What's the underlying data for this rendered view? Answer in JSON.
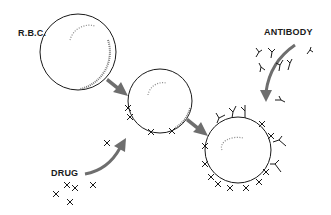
{
  "labels": {
    "rbc": "R.B.C.",
    "antibody": "ANTIBODY",
    "drug": "DRUG"
  },
  "colors": {
    "arrow": "#6e6e6e",
    "outline": "#1a1a1a",
    "background": "#ffffff"
  },
  "stages": [
    {
      "name": "red blood cell",
      "attached": "none"
    },
    {
      "name": "drug-coated red blood cell",
      "attached": "drug"
    },
    {
      "name": "antibody-bound drug-coated red blood cell",
      "attached": "drug + antibody"
    }
  ]
}
